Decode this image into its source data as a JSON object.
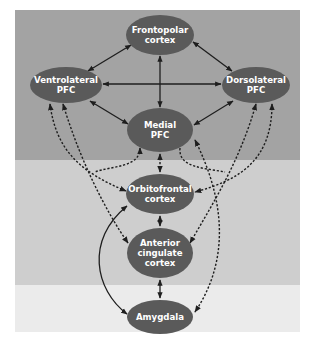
{
  "colors": {
    "band_top": "#a3a3a3",
    "band_middle": "#cecece",
    "band_bottom": "#ebebeb",
    "node_fill": "#5a5a5a",
    "node_text": "#ffffff",
    "arrow": "#1e1e1e"
  },
  "bands": [
    {
      "name": "prefrontal",
      "y": 10,
      "height": 150
    },
    {
      "name": "middle",
      "y": 160,
      "height": 125
    },
    {
      "name": "subcortical",
      "y": 285,
      "height": 47
    }
  ],
  "nodes": {
    "frontopolar": {
      "lines": [
        "Frontopolar",
        "cortex"
      ],
      "cx": 160,
      "cy": 35,
      "rx": 34,
      "ry": 20
    },
    "ventrolateral": {
      "lines": [
        "Ventrolateral",
        "PFC"
      ],
      "cx": 66,
      "cy": 85,
      "rx": 36,
      "ry": 18
    },
    "dorsolateral": {
      "lines": [
        "Dorsolateral",
        "PFC"
      ],
      "cx": 256,
      "cy": 85,
      "rx": 34,
      "ry": 18
    },
    "medial": {
      "lines": [
        "Medial",
        "PFC"
      ],
      "cx": 160,
      "cy": 130,
      "rx": 33,
      "ry": 22
    },
    "orbitofrontal": {
      "lines": [
        "Orbitofrontal",
        "cortex"
      ],
      "cx": 160,
      "cy": 194,
      "rx": 34,
      "ry": 20
    },
    "anterior_cingulate": {
      "lines": [
        "Anterior",
        "cingulate",
        "cortex"
      ],
      "cx": 160,
      "cy": 253,
      "rx": 33,
      "ry": 25
    },
    "amygdala": {
      "lines": [
        "Amygdala"
      ],
      "cx": 160,
      "cy": 317,
      "rx": 33,
      "ry": 17
    }
  },
  "connections": [
    {
      "from": "frontopolar",
      "to": "ventrolateral",
      "style": "solid",
      "direction": "both"
    },
    {
      "from": "frontopolar",
      "to": "dorsolateral",
      "style": "solid",
      "direction": "both"
    },
    {
      "from": "frontopolar",
      "to": "medial",
      "style": "solid",
      "direction": "both"
    },
    {
      "from": "ventrolateral",
      "to": "dorsolateral",
      "style": "solid",
      "direction": "both"
    },
    {
      "from": "ventrolateral",
      "to": "medial",
      "style": "solid",
      "direction": "both"
    },
    {
      "from": "dorsolateral",
      "to": "medial",
      "style": "solid",
      "direction": "both"
    },
    {
      "from": "medial",
      "to": "orbitofrontal",
      "style": "dashed",
      "direction": "both"
    },
    {
      "from": "ventrolateral",
      "to": "orbitofrontal",
      "style": "dashed",
      "direction": "both"
    },
    {
      "from": "ventrolateral",
      "to": "anterior_cingulate",
      "style": "dashed",
      "direction": "both"
    },
    {
      "from": "dorsolateral",
      "to": "orbitofrontal",
      "style": "dashed",
      "direction": "both"
    },
    {
      "from": "dorsolateral",
      "to": "anterior_cingulate",
      "style": "dashed",
      "direction": "both"
    },
    {
      "from": "medial",
      "to": "orbitofrontal_left",
      "style": "dashed",
      "direction": "both"
    },
    {
      "from": "medial",
      "to": "amygdala",
      "style": "dashed",
      "direction": "both"
    },
    {
      "from": "orbitofrontal",
      "to": "anterior_cingulate",
      "style": "solid",
      "direction": "both"
    },
    {
      "from": "orbitofrontal",
      "to": "amygdala",
      "style": "solid",
      "direction": "both"
    },
    {
      "from": "anterior_cingulate",
      "to": "amygdala",
      "style": "solid",
      "direction": "both"
    }
  ]
}
